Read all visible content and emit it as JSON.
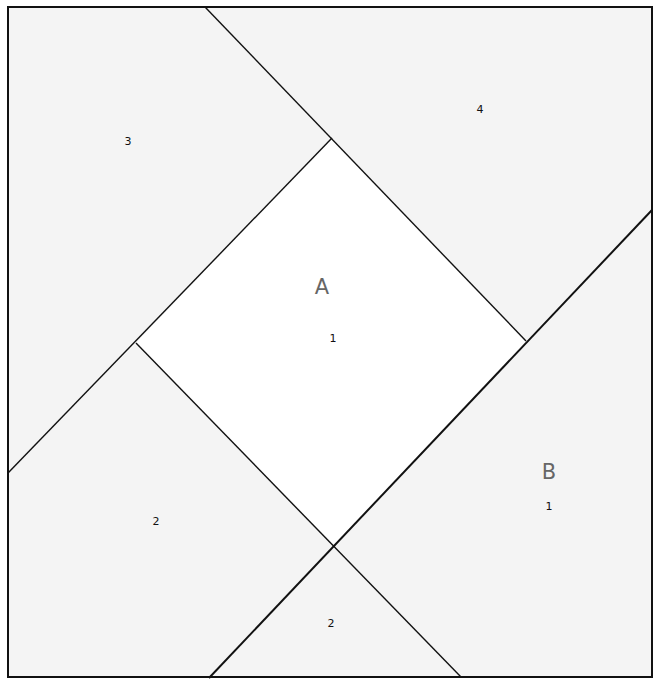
{
  "diagram": {
    "type": "quilt-block-pattern",
    "colors": {
      "border": "#111111",
      "shaded_piece": "#f4f4f4",
      "center_piece": "#ffffff",
      "letter": "#666666",
      "number": "#111111"
    },
    "sections": [
      {
        "id": "A",
        "label": "A"
      },
      {
        "id": "B",
        "label": "B"
      }
    ],
    "pieces": [
      {
        "id": "A1",
        "section": "A",
        "number": "1"
      },
      {
        "id": "A2a",
        "section": "A",
        "number": "2"
      },
      {
        "id": "A2b",
        "section": "A",
        "number": "2"
      },
      {
        "id": "A3",
        "section": "A",
        "number": "3"
      },
      {
        "id": "A4",
        "section": "A",
        "number": "4"
      },
      {
        "id": "B1",
        "section": "B",
        "number": "1"
      }
    ]
  }
}
